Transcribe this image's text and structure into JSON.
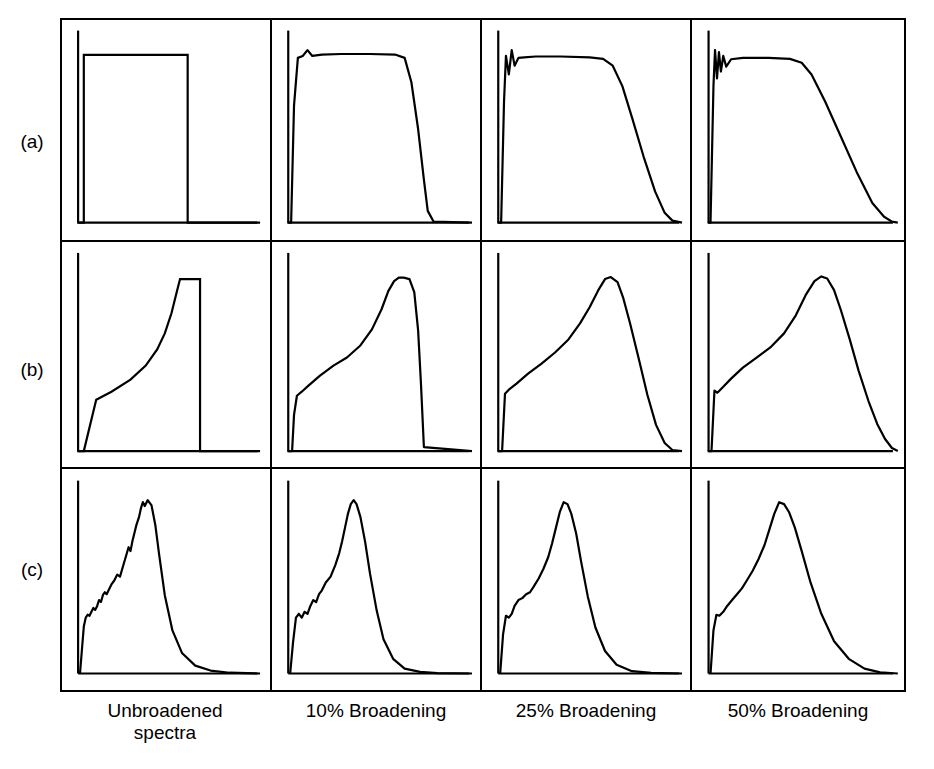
{
  "figure": {
    "type": "multi-panel-spectra-figure",
    "rows": 3,
    "columns": 4,
    "background_color": "#ffffff",
    "line_color": "#000000",
    "frame_color": "#000000"
  },
  "row_labels": [
    {
      "id": "row-a",
      "label": "(a)"
    },
    {
      "id": "row-b",
      "label": "(b)"
    },
    {
      "id": "row-c",
      "label": "(c)"
    }
  ],
  "column_captions": [
    {
      "id": "col-1",
      "line1": "Unbroadened",
      "line2": "spectra"
    },
    {
      "id": "col-2",
      "line1": "10% Broadening",
      "line2": ""
    },
    {
      "id": "col-3",
      "line1": "25% Broadening",
      "line2": ""
    },
    {
      "id": "col-4",
      "line1": "50% Broadening",
      "line2": ""
    }
  ],
  "chart_data": {
    "type": "line",
    "title": "",
    "xlabel": "",
    "ylabel": "",
    "grid": false,
    "legend": "none",
    "axes_style": "left-vertical-axis-and-bottom-baseline-only",
    "panel_grid": {
      "rows": 3,
      "cols": 4
    },
    "row_series_names": [
      "(a)",
      "(b)",
      "(c)"
    ],
    "column_series_names": [
      "Unbroadened spectra",
      "10% Broadening",
      "25% Broadening",
      "50% Broadening"
    ],
    "xlim": [
      0,
      1
    ],
    "ylim": [
      0,
      1
    ],
    "panels": [
      {
        "row": "(a)",
        "column": "Unbroadened spectra",
        "description": "ideal rectangular step: instant rise, flat top, instant fall",
        "x": [
          0.02,
          0.02,
          0.055,
          0.055,
          0.6,
          0.6,
          0.98
        ],
        "y": [
          0.0,
          0.0,
          0.0,
          0.86,
          0.86,
          0.0,
          0.0
        ]
      },
      {
        "row": "(a)",
        "column": "10% Broadening",
        "description": "rounded-corner rectangle with small ringing bump near leading edge",
        "x": [
          0.02,
          0.04,
          0.055,
          0.075,
          0.1,
          0.125,
          0.15,
          0.2,
          0.3,
          0.45,
          0.58,
          0.63,
          0.665,
          0.7,
          0.73,
          0.75,
          0.78,
          0.98
        ],
        "y": [
          0.0,
          0.0,
          0.6,
          0.845,
          0.855,
          0.885,
          0.855,
          0.862,
          0.865,
          0.865,
          0.862,
          0.845,
          0.72,
          0.48,
          0.22,
          0.06,
          0.005,
          0.0
        ]
      },
      {
        "row": "(a)",
        "column": "25% Broadening",
        "description": "rounded plateau with oscillatory leading edge and sloped trailing edge",
        "x": [
          0.02,
          0.04,
          0.055,
          0.065,
          0.08,
          0.095,
          0.11,
          0.13,
          0.16,
          0.22,
          0.35,
          0.5,
          0.57,
          0.62,
          0.67,
          0.72,
          0.78,
          0.84,
          0.89,
          0.93,
          0.98
        ],
        "y": [
          0.0,
          0.0,
          0.62,
          0.855,
          0.76,
          0.885,
          0.805,
          0.845,
          0.848,
          0.852,
          0.852,
          0.848,
          0.84,
          0.805,
          0.7,
          0.54,
          0.34,
          0.16,
          0.05,
          0.01,
          0.0
        ]
      },
      {
        "row": "(a)",
        "column": "50% Broadening",
        "description": "rounded plateau with strong ringing at leading edge and long gradual tail",
        "x": [
          0.02,
          0.035,
          0.05,
          0.058,
          0.068,
          0.078,
          0.088,
          0.1,
          0.115,
          0.14,
          0.2,
          0.33,
          0.44,
          0.5,
          0.55,
          0.62,
          0.7,
          0.78,
          0.86,
          0.92,
          0.96,
          0.99
        ],
        "y": [
          0.0,
          0.0,
          0.7,
          0.885,
          0.74,
          0.875,
          0.775,
          0.855,
          0.8,
          0.838,
          0.845,
          0.845,
          0.84,
          0.82,
          0.76,
          0.62,
          0.44,
          0.26,
          0.1,
          0.03,
          0.005,
          0.0
        ]
      },
      {
        "row": "(b)",
        "column": "Unbroadened spectra",
        "description": "van-Hove style edge: convex rise from finite onset to sharp flat top then vertical drop",
        "x": [
          0.02,
          0.02,
          0.055,
          0.12,
          0.2,
          0.3,
          0.38,
          0.44,
          0.48,
          0.515,
          0.545,
          0.56,
          0.56,
          0.665,
          0.665,
          0.98
        ],
        "y": [
          0.0,
          0.0,
          0.0,
          0.255,
          0.295,
          0.355,
          0.425,
          0.505,
          0.585,
          0.685,
          0.8,
          0.855,
          0.855,
          0.855,
          0.0,
          0.0
        ]
      },
      {
        "row": "(b)",
        "column": "10% Broadening",
        "description": "smoothed rise with low shoulder, rounded crest and steep fall",
        "x": [
          0.02,
          0.045,
          0.055,
          0.07,
          0.095,
          0.13,
          0.19,
          0.26,
          0.33,
          0.4,
          0.46,
          0.51,
          0.545,
          0.575,
          0.6,
          0.625,
          0.655,
          0.68,
          0.7,
          0.715,
          0.73,
          0.98
        ],
        "y": [
          0.0,
          0.0,
          0.18,
          0.275,
          0.295,
          0.325,
          0.375,
          0.425,
          0.465,
          0.525,
          0.605,
          0.705,
          0.795,
          0.845,
          0.862,
          0.862,
          0.855,
          0.79,
          0.6,
          0.33,
          0.02,
          0.0
        ]
      },
      {
        "row": "(b)",
        "column": "25% Broadening",
        "description": "asymmetric rounded peak, slow rise and moderately steep fall",
        "x": [
          0.02,
          0.045,
          0.06,
          0.08,
          0.12,
          0.18,
          0.25,
          0.32,
          0.39,
          0.45,
          0.5,
          0.545,
          0.58,
          0.61,
          0.645,
          0.675,
          0.71,
          0.755,
          0.8,
          0.845,
          0.89,
          0.93,
          0.98
        ],
        "y": [
          0.0,
          0.0,
          0.285,
          0.305,
          0.335,
          0.385,
          0.435,
          0.49,
          0.555,
          0.635,
          0.715,
          0.8,
          0.855,
          0.865,
          0.84,
          0.76,
          0.635,
          0.46,
          0.28,
          0.13,
          0.04,
          0.005,
          0.0
        ]
      },
      {
        "row": "(b)",
        "column": "50% Broadening",
        "description": "broad asymmetric peak with long descending tail",
        "x": [
          0.02,
          0.04,
          0.055,
          0.07,
          0.095,
          0.14,
          0.2,
          0.27,
          0.34,
          0.41,
          0.47,
          0.52,
          0.565,
          0.6,
          0.63,
          0.665,
          0.7,
          0.745,
          0.79,
          0.84,
          0.885,
          0.925,
          0.96,
          0.99
        ],
        "y": [
          0.0,
          0.0,
          0.3,
          0.29,
          0.315,
          0.36,
          0.415,
          0.465,
          0.515,
          0.585,
          0.675,
          0.775,
          0.845,
          0.868,
          0.858,
          0.8,
          0.7,
          0.555,
          0.4,
          0.25,
          0.135,
          0.06,
          0.015,
          0.0
        ]
      },
      {
        "row": "(c)",
        "column": "Unbroadened spectra",
        "description": "experimental noisy spectrum: stepped rising shoulder, sharp jagged peak, exponential tail",
        "x": [
          0.035,
          0.045,
          0.055,
          0.065,
          0.075,
          0.085,
          0.095,
          0.105,
          0.115,
          0.125,
          0.135,
          0.145,
          0.155,
          0.165,
          0.175,
          0.185,
          0.2,
          0.215,
          0.23,
          0.245,
          0.26,
          0.275,
          0.29,
          0.3,
          0.31,
          0.32,
          0.33,
          0.345,
          0.355,
          0.365,
          0.375,
          0.39,
          0.41,
          0.43,
          0.45,
          0.48,
          0.52,
          0.57,
          0.64,
          0.72,
          0.82,
          0.98
        ],
        "y": [
          0.0,
          0.12,
          0.24,
          0.285,
          0.3,
          0.295,
          0.315,
          0.335,
          0.325,
          0.345,
          0.375,
          0.365,
          0.4,
          0.415,
          0.405,
          0.425,
          0.455,
          0.475,
          0.505,
          0.495,
          0.545,
          0.595,
          0.645,
          0.625,
          0.675,
          0.715,
          0.755,
          0.8,
          0.845,
          0.875,
          0.855,
          0.885,
          0.86,
          0.76,
          0.61,
          0.4,
          0.22,
          0.105,
          0.04,
          0.015,
          0.004,
          0.0
        ]
      },
      {
        "row": "(c)",
        "column": "10% Broadening",
        "description": "noise partly smoothed, peak narrowed, structured shoulder retained",
        "x": [
          0.035,
          0.05,
          0.065,
          0.08,
          0.095,
          0.11,
          0.125,
          0.14,
          0.155,
          0.17,
          0.185,
          0.2,
          0.22,
          0.245,
          0.27,
          0.29,
          0.305,
          0.32,
          0.335,
          0.35,
          0.365,
          0.38,
          0.4,
          0.425,
          0.45,
          0.485,
          0.52,
          0.57,
          0.63,
          0.71,
          0.8,
          0.98
        ],
        "y": [
          0.0,
          0.16,
          0.285,
          0.305,
          0.285,
          0.315,
          0.305,
          0.345,
          0.375,
          0.365,
          0.405,
          0.425,
          0.465,
          0.495,
          0.555,
          0.615,
          0.675,
          0.745,
          0.815,
          0.865,
          0.885,
          0.865,
          0.8,
          0.67,
          0.51,
          0.32,
          0.175,
          0.075,
          0.025,
          0.008,
          0.002,
          0.0
        ]
      },
      {
        "row": "(c)",
        "column": "25% Broadening",
        "description": "mostly smooth peak with residual shoulder steps, slightly broadened base",
        "x": [
          0.035,
          0.05,
          0.065,
          0.08,
          0.095,
          0.11,
          0.13,
          0.15,
          0.17,
          0.19,
          0.21,
          0.235,
          0.26,
          0.285,
          0.305,
          0.325,
          0.345,
          0.365,
          0.385,
          0.405,
          0.43,
          0.455,
          0.49,
          0.53,
          0.58,
          0.64,
          0.72,
          0.82,
          0.98
        ],
        "y": [
          0.0,
          0.2,
          0.295,
          0.285,
          0.305,
          0.345,
          0.375,
          0.385,
          0.405,
          0.415,
          0.445,
          0.485,
          0.535,
          0.595,
          0.665,
          0.745,
          0.825,
          0.875,
          0.865,
          0.815,
          0.715,
          0.575,
          0.395,
          0.235,
          0.115,
          0.045,
          0.012,
          0.003,
          0.0
        ]
      },
      {
        "row": "(c)",
        "column": "50% Broadening",
        "description": "fully smoothed single asymmetric peak, small residual shoulder, broad tail",
        "x": [
          0.035,
          0.05,
          0.065,
          0.08,
          0.1,
          0.12,
          0.145,
          0.17,
          0.195,
          0.22,
          0.25,
          0.28,
          0.31,
          0.335,
          0.36,
          0.385,
          0.41,
          0.435,
          0.465,
          0.5,
          0.545,
          0.6,
          0.665,
          0.74,
          0.82,
          0.9,
          0.99
        ],
        "y": [
          0.0,
          0.22,
          0.3,
          0.295,
          0.315,
          0.345,
          0.375,
          0.405,
          0.435,
          0.475,
          0.525,
          0.585,
          0.655,
          0.735,
          0.815,
          0.875,
          0.865,
          0.825,
          0.745,
          0.625,
          0.465,
          0.305,
          0.165,
          0.075,
          0.025,
          0.006,
          0.0
        ]
      }
    ]
  }
}
